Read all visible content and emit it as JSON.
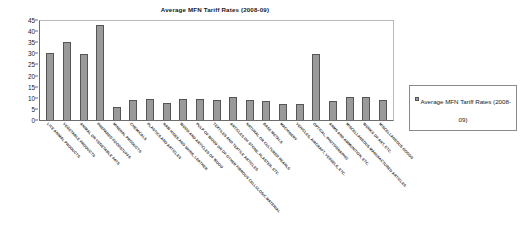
{
  "chart_data": {
    "type": "bar",
    "title": "Average MFN Tariff Rates (2008-09)",
    "xlabel": "",
    "ylabel": "",
    "ylim": [
      0,
      45
    ],
    "ytick_step": 5,
    "yticks": [
      45,
      40,
      35,
      30,
      25,
      20,
      15,
      10,
      5,
      0
    ],
    "grid": false,
    "legend_position": "right",
    "legend": [
      "Average MFN Tariff Rates (2008-09)"
    ],
    "series_name": "Average MFN Tariff Rates (2008-09)",
    "bar_color": "#9a9a9a",
    "bar_border_color": "#555555",
    "categories": [
      "LIVE ANIMAL PRODUCTS",
      "VEGETABLE PRODUCTS",
      "ANIMAL OR VEGETABLE FATS",
      "PREPARED FOODSTUFFS",
      "MINERAL PRODUCTS",
      "CHEMICALS",
      "PLASTICS AND ARTICLES",
      "RAW HIDES AND SKINS, LEATHER",
      "WOOD AND ARTICLES OF WOOD",
      "PULP OF WOOD OR OF OTHER FIBROUS CELLULOSIC MATERIAL",
      "TEXTILES AND TEXTILE ARTICLES",
      "ARTICLES OF STONE, PLASTER, ETC.",
      "NATURAL OR CULTURED PEARLS",
      "BASE METALS",
      "MACHINERY",
      "VEHICLES, AIRCRAFT, VESSELS, ETC.",
      "OPTICAL, PHOTOGRAPHIC",
      "ARMS AND AMMUNITION, ETC.",
      "MISCELLANEOUS MANUFACTURED ARTICLES",
      "WORKS OF ART, ETC.",
      "MISCELLANEOUS GOODS"
    ],
    "values": [
      30.3,
      35.3,
      29.6,
      42.8,
      6.0,
      9.0,
      9.6,
      7.8,
      9.4,
      9.3,
      9.2,
      10.2,
      9.2,
      8.4,
      7.3,
      7.0,
      29.8,
      8.4,
      10.4,
      10.4,
      9.1
    ]
  }
}
